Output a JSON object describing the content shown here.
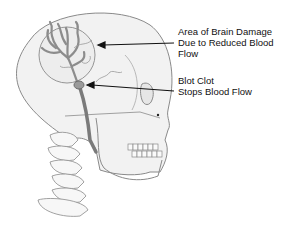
{
  "diagram": {
    "labels": [
      {
        "id": "brain-damage",
        "lines": [
          "Area of Brain Damage",
          "Due to Reduced Blood",
          "Flow"
        ]
      },
      {
        "id": "blood-clot",
        "lines": [
          "Blot Clot",
          "Stops Blood Flow"
        ]
      }
    ],
    "colors": {
      "outline": "#8a8a8a",
      "skull_fill": "#f2f2f2",
      "vessel": "#8c8c8c",
      "arrow": "#111111",
      "text": "#111111",
      "background": "#ffffff"
    }
  }
}
